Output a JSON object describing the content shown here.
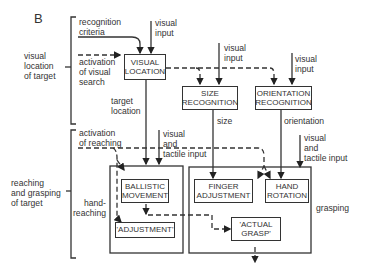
{
  "panel_label": "B",
  "stages": {
    "visual_location": "visual\nlocation\nof target",
    "reaching_grasping": "reaching\nand grasping\nof target"
  },
  "inputs": {
    "recognition_criteria": "recognition\ncriteria",
    "visual_input": "visual\ninput",
    "activation_visual_search": "activation\nof visual\nsearch",
    "target_location": "target\nlocation",
    "size": "size",
    "orientation": "orientation",
    "activation_reaching": "activation\nof reaching",
    "visual_tactile": "visual\nand\ntactile input",
    "hand_reaching": "hand-\nreaching",
    "grasping": "grasping"
  },
  "boxes": {
    "visual_location": "VISUAL\nLOCATION",
    "size_recognition": "SIZE\nRECOGNITION",
    "orientation_recognition": "ORIENTATION\nRECOGNITION",
    "ballistic_movement": "BALLISTIC\nMOVEMENT",
    "adjustment": "'ADJUSTMENT'",
    "finger_adjustment": "FINGER\nADJUSTMENT",
    "hand_rotation": "HAND\nROTATION",
    "actual_grasp": "'ACTUAL\nGRASP'"
  }
}
